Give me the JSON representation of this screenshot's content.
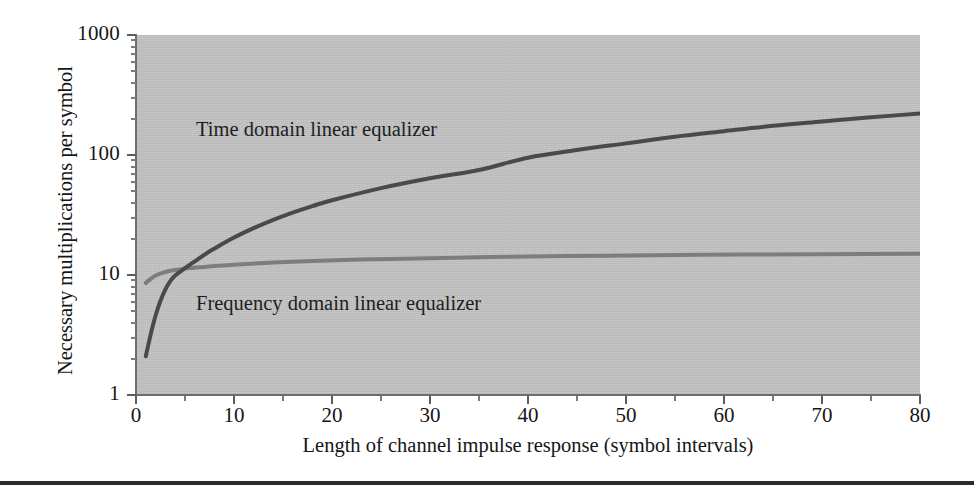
{
  "figure": {
    "background_color": "#ffffff",
    "plot_background_color": "#c3c3c3",
    "bottom_rule_color": "#2b2b2b"
  },
  "chart_data": {
    "type": "line",
    "title": "",
    "subtitle": "",
    "xlabel": "Length of channel impulse response (symbol intervals)",
    "ylabel": "Necessary multiplications per symbol",
    "xlim": [
      0,
      80
    ],
    "ylim": [
      1,
      1000
    ],
    "yscale": "log",
    "xscale": "linear",
    "grid": false,
    "legend_position": "inline-annotation",
    "xticks": [
      0,
      10,
      20,
      30,
      40,
      50,
      60,
      70,
      80
    ],
    "xticklabels": [
      "0",
      "10",
      "20",
      "30",
      "40",
      "50",
      "60",
      "70",
      "80"
    ],
    "yticks": [
      1,
      10,
      100,
      1000
    ],
    "yticklabels": [
      "1",
      "10",
      "100",
      "1000"
    ],
    "series": [
      {
        "name": "Time domain linear equalizer",
        "color": "#4a4a4a",
        "linewidth": 4,
        "annotation": "Time domain linear equalizer",
        "x": [
          1,
          1.5,
          2,
          2.5,
          3,
          3.5,
          4,
          5,
          6,
          7,
          8,
          10,
          12,
          15,
          18,
          20,
          25,
          30,
          35,
          40,
          45,
          50,
          55,
          60,
          65,
          70,
          75,
          80
        ],
        "y": [
          2.1,
          3.2,
          4.6,
          6.1,
          7.6,
          8.9,
          9.9,
          11.4,
          13.0,
          14.8,
          16.6,
          20.5,
          24.6,
          31.0,
          37.5,
          42.0,
          53.0,
          64.0,
          75.0,
          95.0,
          110.0,
          125.0,
          142.0,
          158.0,
          175.0,
          190.0,
          206.0,
          222.0
        ]
      },
      {
        "name": "Frequency domain linear equalizer",
        "color": "#7d7d7d",
        "linewidth": 4,
        "annotation": "Frequency domain linear equalizer",
        "x": [
          1,
          1.5,
          2,
          3,
          4,
          5,
          6,
          8,
          10,
          14,
          18,
          22,
          26,
          30,
          36,
          42,
          48,
          55,
          62,
          70,
          80
        ],
        "y": [
          8.6,
          9.3,
          9.9,
          10.6,
          11.0,
          11.3,
          11.5,
          11.9,
          12.2,
          12.7,
          13.1,
          13.4,
          13.6,
          13.8,
          14.1,
          14.3,
          14.5,
          14.7,
          14.8,
          14.9,
          15.0
        ]
      }
    ],
    "annotations": [
      {
        "text": "Time domain linear equalizer",
        "x_px": 196,
        "y_px": 118
      },
      {
        "text": "Frequency domain linear equalizer",
        "x_px": 196,
        "y_px": 292
      }
    ]
  }
}
